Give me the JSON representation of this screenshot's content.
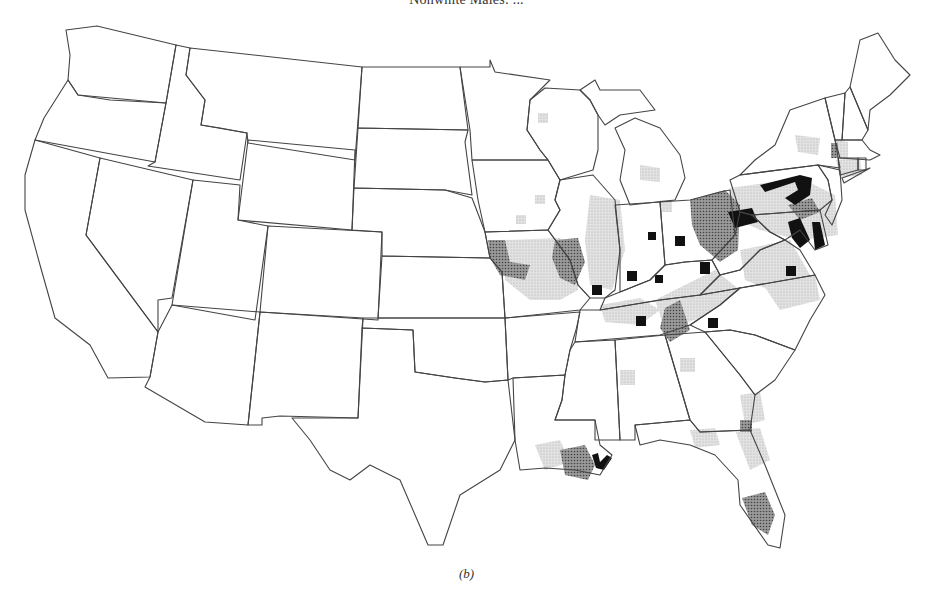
{
  "figure": {
    "title": "Nonwhite Males: ...",
    "caption": "(b)",
    "type": "choropleth map",
    "region": "Contiguous United States, county-level shading"
  },
  "legend": {
    "visible": false,
    "shading_levels": [
      {
        "name": "none",
        "color": "#ffffff"
      },
      {
        "name": "light stipple",
        "color": "#d4d4d4"
      },
      {
        "name": "dark stipple",
        "color": "#8a8a8a"
      },
      {
        "name": "solid black",
        "color": "#111111"
      }
    ]
  },
  "shaded_regions": [
    {
      "area": "Pennsylvania / New Jersey / Maryland",
      "level": "solid black"
    },
    {
      "area": "Southeastern Louisiana (New Orleans area)",
      "level": "solid black"
    },
    {
      "area": "Kentucky / Tennessee scattered counties",
      "level": "solid black"
    },
    {
      "area": "Missouri / Illinois (Mississippi river)",
      "level": "dark stipple"
    },
    {
      "area": "Ohio / West Virginia",
      "level": "dark stipple"
    },
    {
      "area": "Southern Louisiana",
      "level": "dark stipple"
    },
    {
      "area": "South Florida",
      "level": "dark stipple"
    },
    {
      "area": "Appalachia (TN/NC/VA)",
      "level": "light stipple"
    },
    {
      "area": "Midwest scattered counties",
      "level": "light stipple"
    }
  ]
}
